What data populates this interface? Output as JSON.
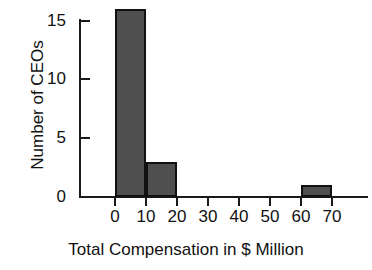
{
  "chart_data": {
    "type": "bar",
    "title": "",
    "subtitle": "",
    "xlabel": "Total Compensation in $ Million",
    "ylabel": "Number of CEOs",
    "bin_width": 10,
    "xlim": [
      0,
      80
    ],
    "ylim": [
      0,
      16
    ],
    "grid": false,
    "legend": null,
    "xticks": [
      "0",
      "10",
      "20",
      "30",
      "40",
      "50",
      "60",
      "70"
    ],
    "xtick_values": [
      0,
      10,
      20,
      30,
      40,
      50,
      60,
      70
    ],
    "yticks": [
      "0",
      "5",
      "10",
      "15"
    ],
    "ytick_values": [
      0,
      5,
      10,
      15
    ],
    "categories": [
      "0-10",
      "10-20",
      "20-30",
      "30-40",
      "40-50",
      "50-60",
      "60-70"
    ],
    "values": [
      16,
      3,
      0,
      0,
      0,
      0,
      1
    ],
    "bins": [
      {
        "start": 0,
        "end": 10,
        "count": 16
      },
      {
        "start": 10,
        "end": 20,
        "count": 3
      },
      {
        "start": 20,
        "end": 30,
        "count": 0
      },
      {
        "start": 30,
        "end": 40,
        "count": 0
      },
      {
        "start": 40,
        "end": 50,
        "count": 0
      },
      {
        "start": 50,
        "end": 60,
        "count": 0
      },
      {
        "start": 60,
        "end": 70,
        "count": 1
      }
    ],
    "colors": {
      "bar_fill": "#4f4f4f",
      "bar_edge": "#111111",
      "axis": "#1a1a1a",
      "text": "#111111",
      "background": "#ffffff"
    }
  }
}
